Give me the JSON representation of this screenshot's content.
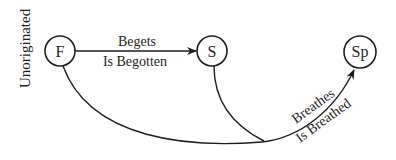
{
  "diagram": {
    "nodes": [
      {
        "id": "F",
        "label": "F",
        "cx": 60,
        "cy": 51,
        "r": 15
      },
      {
        "id": "S",
        "label": "S",
        "cx": 212,
        "cy": 51,
        "r": 15
      },
      {
        "id": "Sp",
        "label": "Sp",
        "cx": 360,
        "cy": 52,
        "r": 16
      }
    ],
    "side_label": "Unoriginated",
    "edges": [
      {
        "from": "F",
        "to": "S",
        "label_top": "Begets",
        "label_bottom": "Is Begotten"
      },
      {
        "from": "F",
        "to": "Sp",
        "label_top": "Breathes",
        "label_bottom": "Is Breathed",
        "joined_by": "S"
      }
    ],
    "stroke_color": "#1e1e1e",
    "background": "#ffffff"
  }
}
